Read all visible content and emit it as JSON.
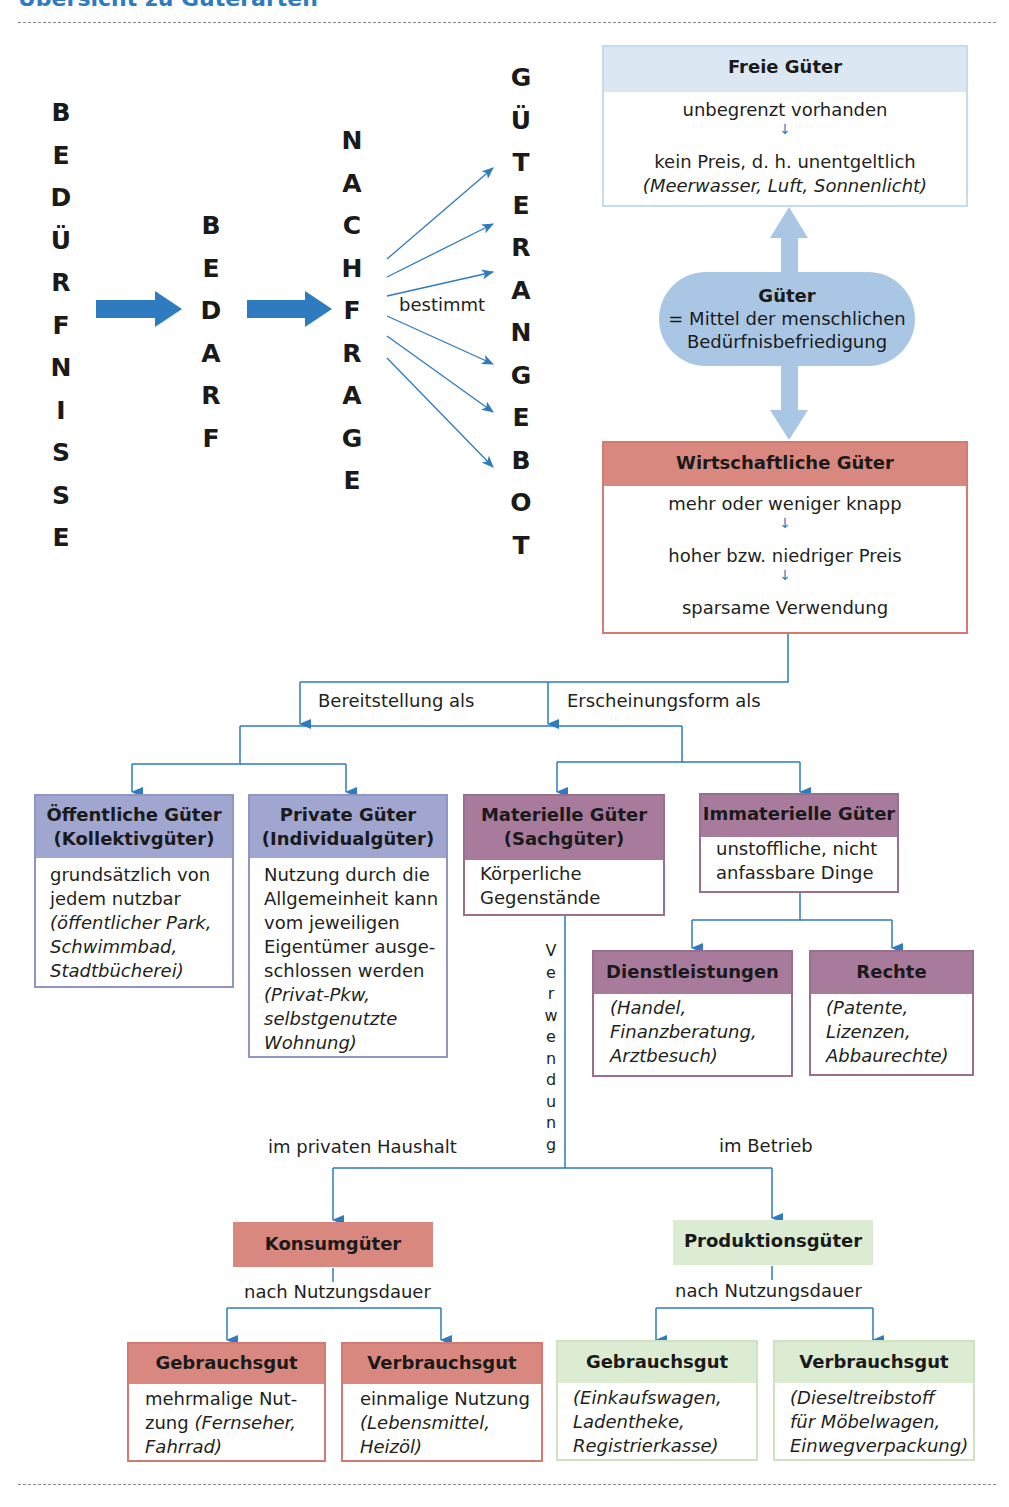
{
  "title": "Übersicht zu Güterarten",
  "colors": {
    "accent_blue": "#2e7bbf",
    "freie_header": "#dbe8f4",
    "freie_border": "#c6dbee",
    "gueter_pill": "#a9c7e4",
    "red_header": "#d98880",
    "red_border": "#d47a72",
    "lavender_header": "#a0a6cf",
    "lavender_border": "#8f96c4",
    "plum_header": "#a87b9c",
    "plum_border": "#9a6f8e",
    "green_header": "#dcecd2",
    "green_border": "#cfe3c3"
  },
  "flow": {
    "beduerfnisse": [
      "B",
      "E",
      "D",
      "Ü",
      "R",
      "F",
      "N",
      "I",
      "S",
      "S",
      "E"
    ],
    "bedarf": [
      "B",
      "E",
      "D",
      "A",
      "R",
      "F"
    ],
    "nachfrage": [
      "N",
      "A",
      "C",
      "H",
      "F",
      "R",
      "A",
      "G",
      "E"
    ],
    "gueterangebot": [
      "G",
      "Ü",
      "T",
      "E",
      "R",
      "A",
      "N",
      "G",
      "E",
      "B",
      "O",
      "T"
    ],
    "bestimmt_label": "bestimmt"
  },
  "freie_gueter": {
    "title": "Freie Güter",
    "line1": "unbegrenzt vorhanden",
    "line2": "kein Preis, d. h. unentgeltlich",
    "examples": "(Meerwasser, Luft, Sonnenlicht)"
  },
  "gueter": {
    "title": "Güter",
    "line1": "= Mittel der menschlichen",
    "line2": "Bedürfnisbefriedigung"
  },
  "wirtschaftliche_gueter": {
    "title": "Wirtschaftliche Güter",
    "line1": "mehr oder weniger knapp",
    "line2": "hoher bzw. niedriger Preis",
    "line3": "sparsame Verwendung"
  },
  "branch_labels": {
    "bereitstellung": "Bereitstellung als",
    "erscheinungsform": "Erscheinungsform als",
    "verwendung": [
      "V",
      "e",
      "r",
      "w",
      "e",
      "n",
      "d",
      "u",
      "n",
      "g"
    ],
    "privat": "im privaten Haushalt",
    "betrieb": "im Betrieb",
    "nutzungsdauer_left": "nach Nutzungsdauer",
    "nutzungsdauer_right": "nach Nutzungsdauer"
  },
  "oeffentliche": {
    "title1": "Öffentliche Güter",
    "title2": "(Kollektivgüter)",
    "line1": "grundsätzlich von",
    "line2": "jedem nutzbar",
    "ex1": "(öffentlicher Park,",
    "ex2": "Schwimmbad,",
    "ex3": "Stadtbücherei)"
  },
  "private": {
    "title1": "Private Güter",
    "title2": "(Individualgüter)",
    "line1": "Nutzung durch die",
    "line2": "Allgemeinheit kann",
    "line3": "vom jeweiligen",
    "line4": "Eigentümer ausge-",
    "line5": "schlossen werden",
    "ex1": "(Privat-Pkw,",
    "ex2": "selbstgenutzte",
    "ex3": "Wohnung)"
  },
  "materielle": {
    "title1": "Materielle Güter",
    "title2": "(Sachgüter)",
    "line1": "Körperliche",
    "line2": "Gegenstände"
  },
  "immaterielle": {
    "title": "Immaterielle Güter",
    "line1": "unstoffliche, nicht",
    "line2": "anfassbare Dinge"
  },
  "dienstleistungen": {
    "title": "Dienstleistungen",
    "ex1": "(Handel,",
    "ex2": "Finanzberatung,",
    "ex3": "Arztbesuch)"
  },
  "rechte": {
    "title": "Rechte",
    "ex1": "(Patente,",
    "ex2": "Lizenzen,",
    "ex3": "Abbaurechte)"
  },
  "konsumgueter": {
    "title": "Konsumgüter"
  },
  "produktionsgueter": {
    "title": "Produktionsgüter"
  },
  "konsum_gebrauchsgut": {
    "title": "Gebrauchsgut",
    "line1": "mehrmalige Nut-",
    "line2a": "zung ",
    "line2b": "(Fernseher,",
    "ex3": "Fahrrad)"
  },
  "konsum_verbrauchsgut": {
    "title": "Verbrauchsgut",
    "line1": "einmalige Nutzung",
    "ex1": "(Lebensmittel,",
    "ex2": "Heizöl)"
  },
  "prod_gebrauchsgut": {
    "title": "Gebrauchsgut",
    "ex1": "(Einkaufswagen,",
    "ex2": "Ladentheke,",
    "ex3": "Registrierkasse)"
  },
  "prod_verbrauchsgut": {
    "title": "Verbrauchsgut",
    "ex1": "(Dieseltreibstoff",
    "ex2": "für Möbelwagen,",
    "ex3": "Einwegverpackung)"
  }
}
